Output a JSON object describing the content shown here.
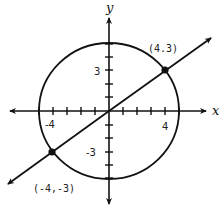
{
  "figure": {
    "axes": {
      "x_label": "x",
      "y_label": "y",
      "tick_labels": {
        "x_neg": "-4",
        "x_pos": "4",
        "y_pos": "3",
        "y_neg": "-3"
      }
    },
    "circle": {
      "center": [
        0,
        0
      ],
      "radius": 5,
      "equation": "x^2 + y^2 = 25"
    },
    "line": {
      "through": [
        [
          -4,
          -3
        ],
        [
          4,
          3
        ]
      ],
      "equation": "y = 3x/4"
    },
    "points": [
      {
        "label": "(4.3)",
        "x": 4,
        "y": 3
      },
      {
        "label": "(-4,-3)",
        "x": -4,
        "y": -3
      }
    ],
    "colors": {
      "stroke": "#111111",
      "background": "#ffffff"
    }
  }
}
